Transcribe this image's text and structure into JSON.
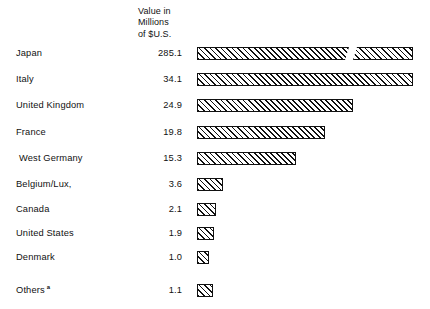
{
  "chart_data": {
    "type": "bar",
    "title": "",
    "subtitle": "",
    "orientation": "horizontal",
    "value_header": [
      "Value in",
      "Millions",
      "of $U.S."
    ],
    "xlabel": "",
    "ylabel": "",
    "unit": "Millions of $U.S.",
    "grid": false,
    "legend": "none",
    "axis_visible": false,
    "xlim": [
      0,
      36
    ],
    "note": "Japan bar is drawn with an axis break because its value greatly exceeds the plotted scale.",
    "categories": [
      "Japan",
      "Italy",
      "United Kingdom",
      "France",
      "West Germany",
      "Belgium/Lux,",
      "Canada",
      "United States",
      "Denmark",
      "Others"
    ],
    "values": [
      285.1,
      34.1,
      24.9,
      19.8,
      15.3,
      3.6,
      2.1,
      1.9,
      1.0,
      1.1
    ],
    "value_labels": [
      "285.1",
      "34.1",
      "24.9",
      "19.8",
      "15.3",
      "3.6",
      "2.1",
      "1.9",
      "1.0",
      "1.1"
    ],
    "footnote_markers": [
      "",
      "",
      "",
      "",
      "",
      "",
      "",
      "",
      "",
      "a"
    ],
    "bar_style": {
      "fill": "diagonal-hatch",
      "hatch_color": "#111111",
      "background": "#ffffff",
      "outline": "#111111"
    }
  },
  "rows": [
    {
      "label": "Japan",
      "value": "285.1",
      "bar_px": 152,
      "bar2_px": 60,
      "broken": true,
      "indent": false,
      "marker": "",
      "top": 44
    },
    {
      "label": "Italy",
      "value": "34.1",
      "bar_px": 216,
      "bar2_px": 0,
      "broken": false,
      "indent": false,
      "marker": "",
      "top": 70
    },
    {
      "label": "United Kingdom",
      "value": "24.9",
      "bar_px": 156,
      "bar2_px": 0,
      "broken": false,
      "indent": false,
      "marker": "",
      "top": 96
    },
    {
      "label": "France",
      "value": "19.8",
      "bar_px": 128,
      "bar2_px": 0,
      "broken": false,
      "indent": false,
      "marker": "",
      "top": 123
    },
    {
      "label": "West Germany",
      "value": "15.3",
      "bar_px": 99,
      "bar2_px": 0,
      "broken": false,
      "indent": true,
      "marker": "",
      "top": 149
    },
    {
      "label": "Belgium/Lux,",
      "value": "3.6",
      "bar_px": 26,
      "bar2_px": 0,
      "broken": false,
      "indent": false,
      "marker": "",
      "top": 175
    },
    {
      "label": "Canada",
      "value": "2.1",
      "bar_px": 19,
      "bar2_px": 0,
      "broken": false,
      "indent": false,
      "marker": "",
      "top": 200
    },
    {
      "label": "United States",
      "value": "1.9",
      "bar_px": 17,
      "bar2_px": 0,
      "broken": false,
      "indent": false,
      "marker": "",
      "top": 224
    },
    {
      "label": "Denmark",
      "value": "1.0",
      "bar_px": 12,
      "bar2_px": 0,
      "broken": false,
      "indent": false,
      "marker": "",
      "top": 248
    },
    {
      "label": "Others",
      "value": "1.1",
      "bar_px": 16,
      "bar2_px": 0,
      "broken": false,
      "indent": false,
      "marker": "a",
      "top": 281
    }
  ],
  "header": {
    "line1": "Value in",
    "line2": "Millions",
    "line3": "of $U.S."
  }
}
